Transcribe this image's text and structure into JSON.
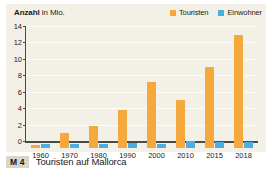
{
  "chart_data": {
    "type": "bar",
    "title": "Anzahl in Mio.",
    "title_strong": "Anzahl",
    "title_rest": " in Mio.",
    "xlabel": "",
    "ylabel": "Anzahl in Mio.",
    "ylim": [
      0,
      14
    ],
    "y_ticks": [
      0,
      2,
      4,
      6,
      8,
      10,
      12,
      14
    ],
    "grid": true,
    "legend_position": "top-right",
    "categories": [
      "1960",
      "1970",
      "1980",
      "1990",
      "2000",
      "2010",
      "2015",
      "2018"
    ],
    "series": [
      {
        "name": "Touristen",
        "color": "#f5a93c",
        "values": [
          0.4,
          1.8,
          2.7,
          4.6,
          8.0,
          5.8,
          9.9,
          13.8
        ]
      },
      {
        "name": "Einwohner",
        "color": "#4baee0",
        "values": [
          0.45,
          0.45,
          0.5,
          0.55,
          0.5,
          0.8,
          0.75,
          0.72
        ]
      }
    ]
  },
  "legend": {
    "items": [
      {
        "label": "Touristen",
        "color": "#f5a93c"
      },
      {
        "label": "Einwohner",
        "color": "#4baee0"
      }
    ]
  },
  "caption": {
    "badge": "M 4",
    "text": "Touristen auf Mallorca"
  },
  "colors": {
    "panel_background": "#f3f1e7",
    "gridline": "#fdfdf8",
    "axis": "#4a4a4a",
    "tourists": "#f5a93c",
    "residents": "#4baee0",
    "badge_background": "#d8d5cc",
    "text": "#1b1b1b"
  }
}
